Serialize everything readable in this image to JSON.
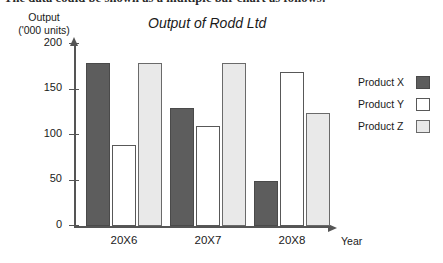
{
  "caption": {
    "text": "The data could be shown as a multiple bar chart as follows:"
  },
  "chart_data": {
    "type": "bar",
    "title": "Output of Rodd Ltd",
    "xlabel": "Year",
    "ylabel": "Output ('000 units)",
    "ylabel_line1": "Output",
    "ylabel_line2": "('000 units)",
    "categories": [
      "20X6",
      "20X7",
      "20X8"
    ],
    "series": [
      {
        "name": "Product X",
        "values": [
          180,
          130,
          50
        ],
        "color": "#5d5d5d"
      },
      {
        "name": "Product Y",
        "values": [
          90,
          110,
          170
        ],
        "color": "#ffffff"
      },
      {
        "name": "Product Z",
        "values": [
          180,
          180,
          125
        ],
        "color": "#e9e9e9"
      }
    ],
    "ylim": [
      0,
      200
    ],
    "yticks": [
      0,
      50,
      100,
      150,
      200
    ],
    "ytick_labels": [
      "0",
      "50",
      "100",
      "150",
      "200"
    ],
    "grid": false,
    "legend_position": "right"
  },
  "legend": {
    "entries": [
      {
        "label": "Product X"
      },
      {
        "label": "Product Y"
      },
      {
        "label": "Product Z"
      }
    ]
  }
}
